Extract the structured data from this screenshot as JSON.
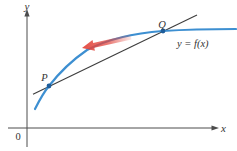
{
  "figure": {
    "axis_labels": {
      "y": "y",
      "x": "x",
      "origin": "0"
    },
    "points": {
      "p": "P",
      "q": "Q"
    },
    "curve_label": "y = f(x)",
    "colors": {
      "curve": "#3d8fd1",
      "point_dot": "#1d5d9b",
      "secant_line": "#3d3d3d",
      "axis": "#4c4c4c",
      "arrow_red": "#e2453c",
      "label_text": "#333333"
    }
  }
}
